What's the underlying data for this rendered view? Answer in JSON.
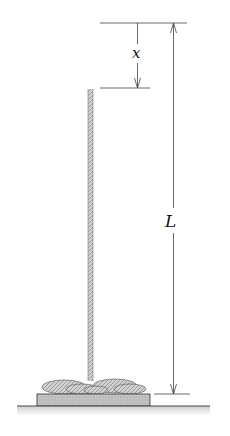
{
  "diagram": {
    "labels": {
      "x": "x",
      "L": "L"
    },
    "colors": {
      "line": "#333333",
      "rope": "#b8b8b8",
      "rope_edge": "#666666",
      "plate": "#bdbdbd",
      "ground": "#d8d8d8"
    }
  }
}
